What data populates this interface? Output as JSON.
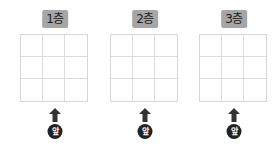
{
  "floors": [
    {
      "label": "1층",
      "front_label": "앞",
      "rows": 3,
      "cols": 3
    },
    {
      "label": "2층",
      "front_label": "앞",
      "rows": 3,
      "cols": 3
    },
    {
      "label": "3층",
      "front_label": "앞",
      "rows": 3,
      "cols": 3
    }
  ],
  "colors": {
    "label_bg": "#a6a6a6",
    "grid_line": "#d6d6d6",
    "arrow": "#333333",
    "badge_bg": "#222222"
  }
}
